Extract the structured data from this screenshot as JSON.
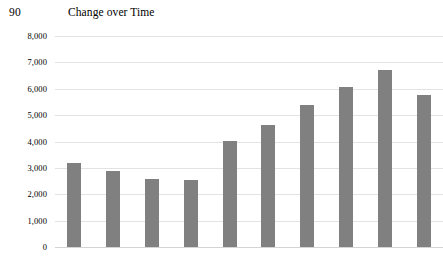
{
  "header": {
    "page_number": "90",
    "title": "Change over Time"
  },
  "chart": {
    "bar_color": "#808080",
    "gridline_color": "#e3e3e3",
    "background_color": "#ffffff"
  },
  "chart_data": {
    "type": "bar",
    "title": "Change over Time",
    "xlabel": "",
    "ylabel": "",
    "ylim": [
      0,
      8000
    ],
    "ytick_labels": [
      "8,000",
      "7,000",
      "6,000",
      "5,000",
      "4,000",
      "3,000",
      "2,000",
      "1,000",
      "0"
    ],
    "ytick_values": [
      8000,
      7000,
      6000,
      5000,
      4000,
      3000,
      2000,
      1000,
      0
    ],
    "grid": true,
    "legend": false,
    "categories": [
      "1",
      "2",
      "3",
      "4",
      "5",
      "6",
      "7",
      "8",
      "9",
      "10"
    ],
    "values": [
      3200,
      2880,
      2580,
      2550,
      4030,
      4620,
      5380,
      6060,
      6700,
      5780
    ]
  }
}
